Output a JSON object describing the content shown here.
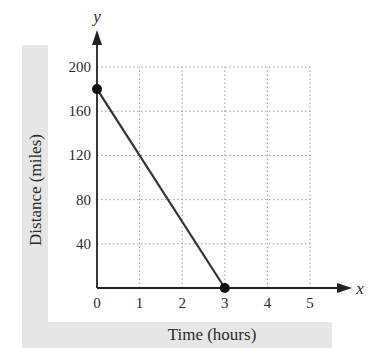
{
  "chart_data": {
    "type": "line",
    "title": "",
    "xlabel": "Time (hours)",
    "ylabel": "Distance (miles)",
    "x_axis_name": "x",
    "y_axis_name": "y",
    "xlim": [
      0,
      5
    ],
    "ylim": [
      0,
      200
    ],
    "x_ticks": [
      "0",
      "1",
      "2",
      "3",
      "4",
      "5"
    ],
    "y_ticks": [
      "40",
      "80",
      "120",
      "160",
      "200"
    ],
    "grid": true,
    "grid_style": "dotted",
    "legend": null,
    "series": [
      {
        "name": "distance",
        "x": [
          0,
          3
        ],
        "y": [
          180,
          0
        ],
        "markers": "endpoints",
        "color": "#333333"
      }
    ]
  },
  "colors": {
    "axis": "#222222",
    "line": "#333333",
    "grid": "#9a9a9a",
    "label_band": "#e6e6e6"
  }
}
